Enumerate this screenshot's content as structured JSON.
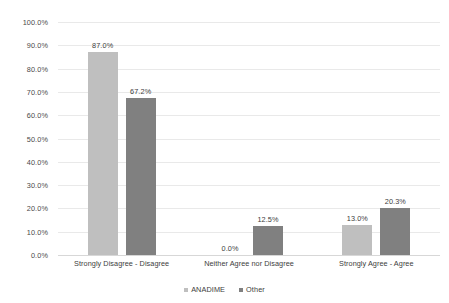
{
  "chart_data": {
    "type": "bar",
    "title": "",
    "xlabel": "",
    "ylabel": "",
    "ylim": [
      0,
      100
    ],
    "grid": true,
    "legend_position": "bottom",
    "categories": [
      "Strongly Disagree - Disagree",
      "Neither Agree nor Disagree",
      "Strongly Agree - Agree"
    ],
    "series": [
      {
        "name": "ANADIME",
        "color": "#bfbfbf",
        "values": [
          87.0,
          0.0,
          13.0
        ],
        "labels": [
          "87.0%",
          "0.0%",
          "13.0%"
        ]
      },
      {
        "name": "Other",
        "color": "#808080",
        "values": [
          67.2,
          12.5,
          20.3
        ],
        "labels": [
          "67.2%",
          "12.5%",
          "20.3%"
        ]
      }
    ],
    "y_ticks": [
      "0.0%",
      "10.0%",
      "20.0%",
      "30.0%",
      "40.0%",
      "50.0%",
      "60.0%",
      "70.0%",
      "80.0%",
      "90.0%",
      "100.0%"
    ],
    "y_tick_values": [
      0,
      10,
      20,
      30,
      40,
      50,
      60,
      70,
      80,
      90,
      100
    ],
    "gridline_color": "#e9e9e9",
    "background_color": "#ffffff"
  },
  "legend": {
    "items": [
      {
        "label": "ANADIME",
        "color": "#bfbfbf"
      },
      {
        "label": "Other",
        "color": "#808080"
      }
    ]
  }
}
